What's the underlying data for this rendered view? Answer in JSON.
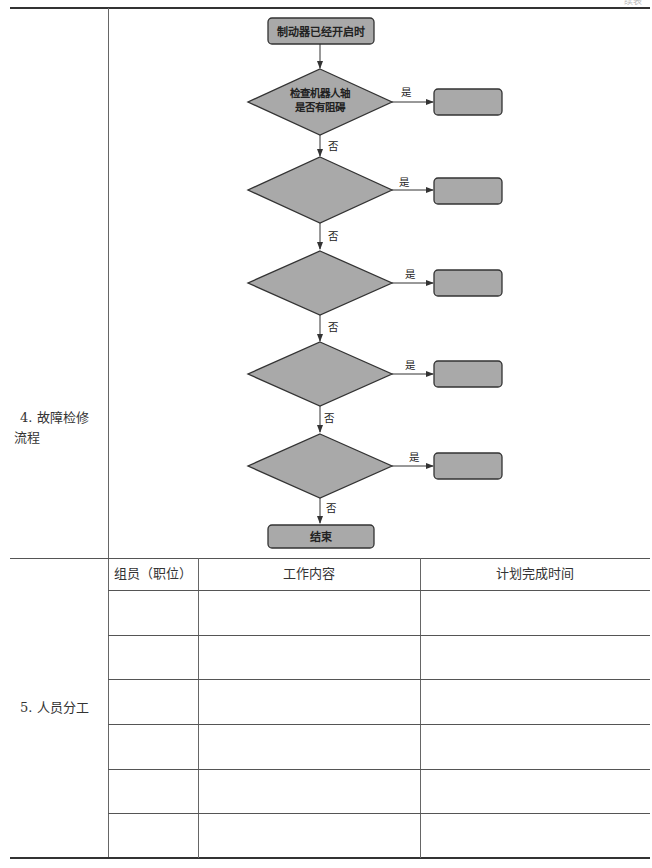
{
  "page": {
    "continued_mark": "续表"
  },
  "section4": {
    "label_line1": "4. 故障检修",
    "label_line2": "流程",
    "flowchart": {
      "start": "制动器已经开启时",
      "decisions": [
        {
          "text_line1": "检查机器人轴",
          "text_line2": "是否有阻碍",
          "yes_label": "是",
          "no_label": "否",
          "yes_box": ""
        },
        {
          "text_line1": "",
          "text_line2": "",
          "yes_label": "是",
          "no_label": "否",
          "yes_box": ""
        },
        {
          "text_line1": "",
          "text_line2": "",
          "yes_label": "是",
          "no_label": "否",
          "yes_box": ""
        },
        {
          "text_line1": "",
          "text_line2": "",
          "yes_label": "是",
          "no_label": "否",
          "yes_box": ""
        },
        {
          "text_line1": "",
          "text_line2": "",
          "yes_label": "是",
          "no_label": "否",
          "yes_box": ""
        }
      ],
      "end": "结束",
      "colors": {
        "fill": "#a9a9a9",
        "stroke": "#333333"
      }
    }
  },
  "section5": {
    "label": "5. 人员分工",
    "headers": [
      "组员（职位）",
      "工作内容",
      "计划完成时间"
    ],
    "rows": [
      [
        "",
        "",
        ""
      ],
      [
        "",
        "",
        ""
      ],
      [
        "",
        "",
        ""
      ],
      [
        "",
        "",
        ""
      ],
      [
        "",
        "",
        ""
      ],
      [
        "",
        "",
        ""
      ]
    ]
  }
}
